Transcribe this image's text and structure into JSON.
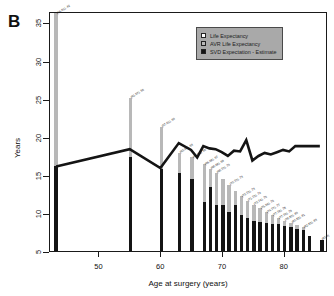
{
  "panel": {
    "letter": "B"
  },
  "axes": {
    "ylabel": "Years",
    "xlabel": "Age at surgery (years)",
    "yticks": [
      5,
      10,
      15,
      20,
      25,
      30,
      35
    ],
    "xticks": [
      50,
      60,
      70,
      80
    ]
  },
  "legend": {
    "position": "top-right",
    "items": [
      {
        "label": "Life Expectancy",
        "color": "#ffffff",
        "key": "life-expectancy"
      },
      {
        "label": "AVR Life Expectancy",
        "color": "#b8b8b8",
        "key": "avr-life-expectancy"
      },
      {
        "label": "SVD Expectation - Estimate",
        "color": "#141414",
        "key": "svd-expectation-estimate"
      }
    ]
  },
  "chart_data": {
    "type": "bar",
    "title": "",
    "xlabel": "Age at surgery (years)",
    "ylabel": "Years",
    "xlim": [
      42,
      87
    ],
    "ylim": [
      5,
      36.5
    ],
    "grid": false,
    "legend_position": "top-right",
    "series": [
      {
        "name": "AVR Life Expectancy",
        "color": "#b8b8b8"
      },
      {
        "name": "SVD Expectation - Estimate",
        "color": "#141414"
      }
    ],
    "x": [
      43,
      55,
      60,
      63,
      65,
      67,
      68,
      69,
      70,
      71,
      72,
      73,
      74,
      75,
      76,
      77,
      78,
      79,
      80,
      81,
      82,
      83,
      84,
      86
    ],
    "avr_life_expectancy": [
      36.2,
      25.1,
      21.3,
      17.9,
      17.3,
      16.4,
      15.8,
      15.3,
      14.4,
      13.7,
      12.9,
      12.2,
      11.6,
      11.1,
      10.6,
      10.1,
      9.7,
      9.3,
      9.0,
      8.7,
      8.4,
      8.1,
      7.0,
      6.5
    ],
    "svd_expectation_estimate": [
      16.2,
      17.3,
      15.7,
      15.3,
      14.4,
      11.4,
      13.4,
      11.1,
      11.0,
      10.1,
      11.1,
      9.7,
      9.3,
      9.0,
      8.8,
      8.7,
      8.6,
      8.5,
      8.3,
      8.1,
      7.9,
      7.8,
      7.0,
      6.5
    ],
    "life_expectancy_line": {
      "name": "Life Expectancy",
      "color": "#141414",
      "x": [
        43,
        55,
        60,
        63,
        65,
        66,
        67,
        68,
        69,
        70,
        71,
        72,
        73,
        74,
        75,
        76,
        77,
        78,
        79,
        80,
        81,
        82,
        83,
        84,
        85,
        86
      ],
      "y": [
        16.2,
        18.5,
        16.0,
        19.3,
        18.4,
        17.4,
        18.9,
        18.6,
        18.5,
        18.1,
        17.6,
        18.3,
        18.2,
        19.7,
        17.0,
        17.6,
        18.0,
        17.8,
        18.1,
        18.4,
        18.2,
        18.9,
        18.9,
        18.9,
        18.9,
        18.9
      ]
    },
    "bar_labels": [
      {
        "x": 43,
        "text": "(16,91), 42"
      },
      {
        "x": 55,
        "text": "(61,57), 55"
      },
      {
        "x": 60,
        "text": "(57,61), 60"
      },
      {
        "x": 63,
        "text": "(63,64), 63"
      },
      {
        "x": 65,
        "text": "(64,66), 65"
      },
      {
        "x": 67,
        "text": "(66,68), 67"
      },
      {
        "x": 68,
        "text": "(68,68), 69"
      },
      {
        "x": 69,
        "text": "(68,70), 70"
      },
      {
        "x": 71,
        "text": "(70,70), 73"
      },
      {
        "x": 73,
        "text": "(73,73), 73"
      },
      {
        "x": 74,
        "text": "(71,73), 74"
      },
      {
        "x": 75,
        "text": "(73,74), 75"
      },
      {
        "x": 76,
        "text": "(75,56), 76"
      },
      {
        "x": 77,
        "text": "(74,77), 77"
      },
      {
        "x": 78,
        "text": "(77,78), 78"
      },
      {
        "x": 79,
        "text": "(77,79), 79"
      },
      {
        "x": 80,
        "text": "(78,80), 80"
      },
      {
        "x": 81,
        "text": "(80,82), 81"
      },
      {
        "x": 83,
        "text": "(82,83), 83"
      },
      {
        "x": 86,
        "text": "(83,9)"
      }
    ]
  }
}
